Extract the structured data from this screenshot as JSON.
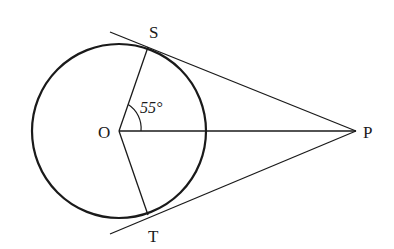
{
  "diagram": {
    "points": {
      "O": {
        "label": "O",
        "x": 119,
        "y": 131
      },
      "S": {
        "label": "S",
        "x": 148,
        "y": 46
      },
      "T": {
        "label": "T",
        "x": 148,
        "y": 216
      },
      "P": {
        "label": "P",
        "x": 356,
        "y": 131
      }
    },
    "circle": {
      "cx": 119,
      "cy": 131,
      "r": 87
    },
    "angle": {
      "label": "55°",
      "vertex": "O",
      "between": [
        "OS",
        "OP"
      ]
    },
    "colors": {
      "stroke": "#1a1a1a",
      "background": "#ffffff"
    }
  }
}
